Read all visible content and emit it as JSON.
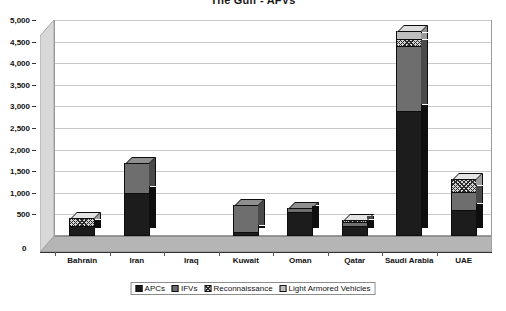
{
  "chart_data": {
    "type": "bar",
    "subtype": "stacked-column-3d",
    "title": "The Gulf - AFVs",
    "xlabel": "",
    "ylabel": "",
    "ylim": [
      0,
      5000
    ],
    "ytick_step": 500,
    "grid": true,
    "legend_position": "bottom",
    "categories": [
      "Bahrain",
      "Iran",
      "Iraq",
      "Kuwait",
      "Oman",
      "Qatar",
      "Saudi Arabia",
      "UAE"
    ],
    "ytick_labels": [
      "0",
      "500",
      "1,000",
      "1,500",
      "2,000",
      "2,500",
      "3,000",
      "3,500",
      "4,000",
      "4,500",
      "5,000"
    ],
    "series": [
      {
        "name": "APCs",
        "color": "#1c1c1c",
        "pattern": "solid-dark",
        "values": [
          235,
          1000,
          0,
          100,
          550,
          225,
          2900,
          600
        ]
      },
      {
        "name": "IFVs",
        "color": "#6e6e6e",
        "pattern": "solid-gray",
        "values": [
          0,
          700,
          0,
          620,
          100,
          100,
          1500,
          420
        ]
      },
      {
        "name": "Reconnaissance",
        "color": "#d5d5d5",
        "pattern": "cross-hatch",
        "values": [
          190,
          0,
          0,
          0,
          0,
          50,
          150,
          300
        ]
      },
      {
        "name": "Light Armored Vehicles",
        "color": "#bfbfbf",
        "pattern": "solid-light",
        "values": [
          0,
          0,
          0,
          0,
          0,
          0,
          200,
          0
        ]
      }
    ],
    "totals": [
      425,
      1700,
      0,
      720,
      650,
      375,
      4750,
      1320
    ]
  },
  "legend": {
    "items": [
      {
        "label": "APCs"
      },
      {
        "label": "IFVs"
      },
      {
        "label": "Reconnaissance"
      },
      {
        "label": "Light Armored Vehicles"
      }
    ]
  },
  "axis": {
    "zero_label": "0"
  }
}
